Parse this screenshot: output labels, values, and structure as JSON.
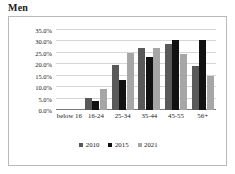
{
  "title": "Men",
  "chart_data": {
    "type": "bar",
    "title": "Men",
    "xlabel": "",
    "ylabel": "",
    "categories": [
      "below 16",
      "16-24",
      "25-34",
      "35-44",
      "45-55",
      "56+"
    ],
    "series": [
      {
        "name": "2010",
        "color": "#595959",
        "values": [
          0.0,
          5.3,
          19.5,
          27.3,
          29.0,
          19.3
        ]
      },
      {
        "name": "2015",
        "color": "#111111",
        "values": [
          0.0,
          4.0,
          13.0,
          23.0,
          30.5,
          30.5
        ]
      },
      {
        "name": "2021",
        "color": "#a6a6a6",
        "values": [
          0.0,
          9.3,
          25.0,
          27.0,
          24.5,
          14.7
        ]
      }
    ],
    "ylim": [
      0,
      35
    ],
    "ytick_values": [
      0,
      5,
      10,
      15,
      20,
      25,
      30,
      35
    ],
    "ytick_labels": [
      "0.0%",
      "5.0%",
      "10.0%",
      "15.0%",
      "20.0%",
      "25.0%",
      "30.0%",
      "35.0%"
    ],
    "value_suffix": "%",
    "grid": true,
    "legend_position": "bottom"
  },
  "legend": {
    "items": [
      {
        "label": "2010",
        "color": "#595959"
      },
      {
        "label": "2015",
        "color": "#111111"
      },
      {
        "label": "2021",
        "color": "#a6a6a6"
      }
    ]
  },
  "colors": {
    "gridline": "#d6d6d6",
    "axis": "#7b7b7b",
    "frame_border": "#b9b9b9",
    "background": "#ffffff",
    "text": "#1a1a1a"
  }
}
